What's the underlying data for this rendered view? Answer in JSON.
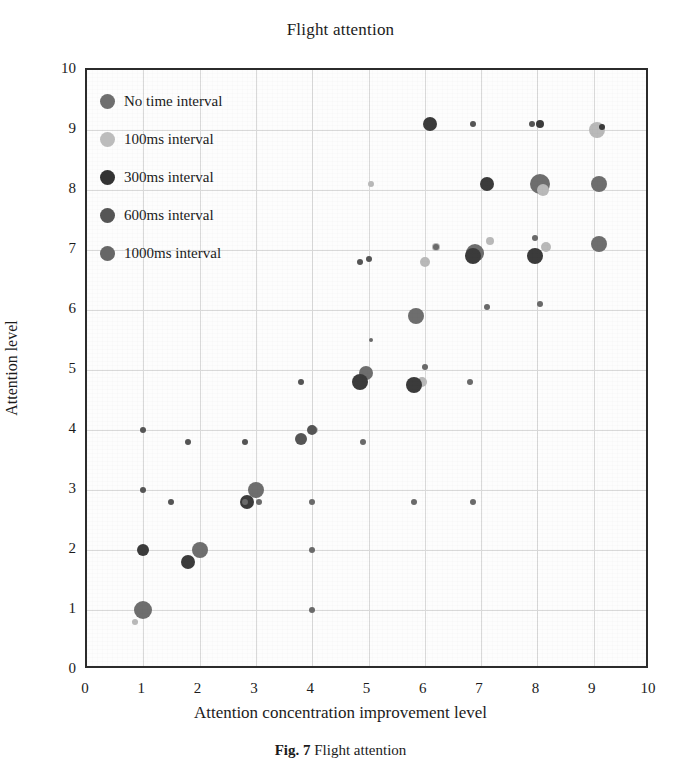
{
  "chart_data": {
    "type": "scatter",
    "title": "Flight attention",
    "xlabel": "Attention concentration improvement level",
    "ylabel": "Attention level",
    "xlim": [
      0,
      10
    ],
    "ylim": [
      0,
      10
    ],
    "xticks": [
      "0",
      "1",
      "2",
      "3",
      "4",
      "5",
      "6",
      "7",
      "8",
      "9",
      "10"
    ],
    "yticks": [
      "0",
      "1",
      "2",
      "3",
      "4",
      "5",
      "6",
      "7",
      "8",
      "9",
      "10"
    ],
    "grid": true,
    "legend_position": "top-left",
    "series": [
      {
        "name": "No time interval",
        "color": "#6e6e6e",
        "points": [
          {
            "x": 1.0,
            "y": 1.0,
            "r": 9
          },
          {
            "x": 2.0,
            "y": 2.0,
            "r": 8
          },
          {
            "x": 3.0,
            "y": 3.0,
            "r": 8
          },
          {
            "x": 4.95,
            "y": 4.95,
            "r": 7
          },
          {
            "x": 5.85,
            "y": 5.9,
            "r": 8
          },
          {
            "x": 6.9,
            "y": 6.95,
            "r": 9
          },
          {
            "x": 8.05,
            "y": 8.1,
            "r": 10
          },
          {
            "x": 9.1,
            "y": 8.1,
            "r": 8
          },
          {
            "x": 9.1,
            "y": 7.1,
            "r": 8
          }
        ]
      },
      {
        "name": "100ms interval",
        "color": "#b9b9b9",
        "points": [
          {
            "x": 0.85,
            "y": 0.8,
            "r": 3
          },
          {
            "x": 4.05,
            "y": 4.0,
            "r": 3
          },
          {
            "x": 5.05,
            "y": 8.1,
            "r": 3
          },
          {
            "x": 6.2,
            "y": 7.05,
            "r": 4
          },
          {
            "x": 7.15,
            "y": 7.15,
            "r": 4
          },
          {
            "x": 8.1,
            "y": 8.0,
            "r": 6
          },
          {
            "x": 8.15,
            "y": 7.05,
            "r": 5
          },
          {
            "x": 9.05,
            "y": 9.0,
            "r": 8
          },
          {
            "x": 6.0,
            "y": 6.8,
            "r": 5
          },
          {
            "x": 5.95,
            "y": 4.8,
            "r": 5
          }
        ]
      },
      {
        "name": "300ms interval",
        "color": "#3b3b3b",
        "points": [
          {
            "x": 1.0,
            "y": 2.0,
            "r": 6
          },
          {
            "x": 1.8,
            "y": 1.8,
            "r": 7
          },
          {
            "x": 2.85,
            "y": 2.8,
            "r": 7
          },
          {
            "x": 4.85,
            "y": 4.8,
            "r": 8
          },
          {
            "x": 5.8,
            "y": 4.75,
            "r": 8
          },
          {
            "x": 6.85,
            "y": 6.9,
            "r": 8
          },
          {
            "x": 7.95,
            "y": 6.9,
            "r": 8
          },
          {
            "x": 6.1,
            "y": 9.1,
            "r": 7
          },
          {
            "x": 8.05,
            "y": 9.1,
            "r": 4
          },
          {
            "x": 9.15,
            "y": 9.05,
            "r": 3
          },
          {
            "x": 7.1,
            "y": 8.1,
            "r": 7
          }
        ]
      },
      {
        "name": "600ms interval",
        "color": "#555555",
        "points": [
          {
            "x": 1.0,
            "y": 3.0,
            "r": 3
          },
          {
            "x": 1.0,
            "y": 4.0,
            "r": 3
          },
          {
            "x": 1.5,
            "y": 2.8,
            "r": 3
          },
          {
            "x": 1.8,
            "y": 3.8,
            "r": 3
          },
          {
            "x": 2.8,
            "y": 3.8,
            "r": 3
          },
          {
            "x": 3.8,
            "y": 3.85,
            "r": 6
          },
          {
            "x": 4.0,
            "y": 4.0,
            "r": 5
          },
          {
            "x": 3.8,
            "y": 4.8,
            "r": 3
          },
          {
            "x": 4.85,
            "y": 6.8,
            "r": 3
          },
          {
            "x": 5.0,
            "y": 6.85,
            "r": 3
          },
          {
            "x": 6.85,
            "y": 9.1,
            "r": 3
          },
          {
            "x": 7.9,
            "y": 9.1,
            "r": 3
          }
        ]
      },
      {
        "name": "1000ms interval",
        "color": "#6a6a6a",
        "points": [
          {
            "x": 2.8,
            "y": 2.8,
            "r": 3
          },
          {
            "x": 3.05,
            "y": 2.8,
            "r": 3
          },
          {
            "x": 4.0,
            "y": 2.8,
            "r": 3
          },
          {
            "x": 4.0,
            "y": 2.0,
            "r": 3
          },
          {
            "x": 4.0,
            "y": 1.0,
            "r": 3
          },
          {
            "x": 4.9,
            "y": 3.8,
            "r": 3
          },
          {
            "x": 5.8,
            "y": 2.8,
            "r": 3
          },
          {
            "x": 6.0,
            "y": 5.05,
            "r": 3
          },
          {
            "x": 6.85,
            "y": 2.8,
            "r": 3
          },
          {
            "x": 6.8,
            "y": 4.8,
            "r": 3
          },
          {
            "x": 7.95,
            "y": 7.2,
            "r": 3
          },
          {
            "x": 8.05,
            "y": 6.1,
            "r": 3
          },
          {
            "x": 7.1,
            "y": 6.05,
            "r": 3
          },
          {
            "x": 6.2,
            "y": 7.05,
            "r": 3
          },
          {
            "x": 5.05,
            "y": 5.5,
            "r": 2
          }
        ]
      }
    ]
  },
  "legend": {
    "items": [
      {
        "label": "No time interval",
        "color": "#6e6e6e",
        "size": 15
      },
      {
        "label": "100ms interval",
        "color": "#bcbcbc",
        "size": 15
      },
      {
        "label": "300ms interval",
        "color": "#333333",
        "size": 15
      },
      {
        "label": "600ms interval",
        "color": "#555555",
        "size": 15
      },
      {
        "label": "1000ms interval",
        "color": "#676767",
        "size": 15
      }
    ]
  },
  "caption": {
    "number": "Fig. 7",
    "text": "Flight attention"
  }
}
